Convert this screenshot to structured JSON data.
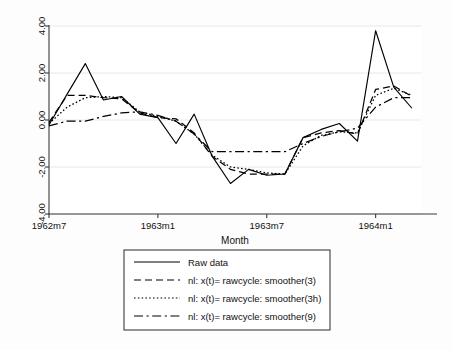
{
  "figure": {
    "background_color": "#fdfdfd",
    "plot_background_color": "#ffffff",
    "line_color": "#000000",
    "grid_color": "#e8e8e8",
    "axis_color": "#3a3a3a"
  },
  "chart_data": {
    "type": "line",
    "title": "",
    "xlabel": "Month",
    "ylabel": "",
    "xlim": [
      0,
      20.5
    ],
    "ylim": [
      -4.0,
      4.0
    ],
    "grid": true,
    "legend_position": "below",
    "x_tick_labels": [
      "1962m7",
      "1963m1",
      "1963m7",
      "1964m1"
    ],
    "x_tick_values": [
      0,
      6,
      12,
      18
    ],
    "y_tick_labels": [
      "4.00",
      "2.00",
      "0.00",
      "-2.00",
      "-4.00"
    ],
    "y_tick_values": [
      4,
      2,
      0,
      -2,
      -4
    ],
    "x": [
      0,
      1,
      2,
      3,
      4,
      5,
      6,
      7,
      8,
      9,
      10,
      11,
      12,
      13,
      14,
      15,
      16,
      17,
      18,
      19,
      20
    ],
    "series": [
      {
        "name": "Raw data",
        "style": "solid",
        "values": [
          -0.2,
          1.1,
          2.4,
          0.85,
          1.0,
          0.25,
          0.1,
          -1.0,
          0.25,
          -1.55,
          -2.7,
          -2.1,
          -2.35,
          -2.3,
          -0.75,
          -0.4,
          -0.15,
          -0.9,
          3.8,
          1.4,
          0.5
        ]
      },
      {
        "name": "nl: x(t)= rawcycle: smoother(3)",
        "style": "dashed",
        "values": [
          -0.1,
          1.05,
          1.05,
          0.95,
          0.9,
          0.3,
          0.1,
          0.05,
          -0.55,
          -1.55,
          -2.1,
          -2.3,
          -2.3,
          -2.3,
          -0.75,
          -0.55,
          -0.45,
          -0.6,
          1.3,
          1.45,
          1.0
        ]
      },
      {
        "name": "nl: x(t)= rawcycle: smoother(3h)",
        "style": "dotted",
        "values": [
          -0.15,
          0.55,
          0.95,
          1.0,
          0.95,
          0.35,
          0.15,
          -0.05,
          -0.6,
          -1.5,
          -2.0,
          -2.1,
          -2.25,
          -2.3,
          -1.1,
          -0.65,
          -0.5,
          -0.55,
          1.05,
          1.35,
          1.05
        ]
      },
      {
        "name": "nl: x(t)= rawcycle: smoother(9)",
        "style": "dashdot",
        "values": [
          -0.25,
          -0.05,
          -0.05,
          0.15,
          0.3,
          0.35,
          0.2,
          -0.05,
          -0.6,
          -1.35,
          -1.35,
          -1.35,
          -1.35,
          -1.35,
          -1.0,
          -0.7,
          -0.5,
          -0.35,
          0.55,
          0.95,
          0.95
        ]
      }
    ]
  },
  "legend": {
    "entries": [
      {
        "label": "Raw data",
        "style": "solid"
      },
      {
        "label": "nl: x(t)= rawcycle: smoother(3)",
        "style": "dashed"
      },
      {
        "label": "nl: x(t)= rawcycle: smoother(3h)",
        "style": "dotted"
      },
      {
        "label": "nl: x(t)= rawcycle: smoother(9)",
        "style": "dashdot"
      }
    ]
  }
}
